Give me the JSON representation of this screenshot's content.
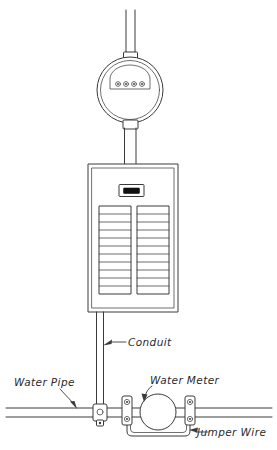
{
  "diagram": {
    "ink_color": "#3a3a3a",
    "background_color": "#ffffff",
    "labels": [
      {
        "id": "conduit",
        "text": "Conduit",
        "x": 128,
        "y": 344
      },
      {
        "id": "water-pipe",
        "text": "Water Pipe",
        "x": 14,
        "y": 384
      },
      {
        "id": "water-meter",
        "text": "Water Meter",
        "x": 150,
        "y": 382
      },
      {
        "id": "jumper-wire",
        "text": "Jumper Wire",
        "x": 197,
        "y": 437
      }
    ],
    "components": {
      "service_riser": {
        "name": "service-riser-conduit",
        "top_y": 10,
        "bottom_y": 55,
        "center_x": 130,
        "width": 9
      },
      "electric_meter": {
        "name": "electric-meter",
        "center_x": 130,
        "center_y": 89,
        "radius": 33,
        "dial_count": 4,
        "dial_labels": [
          "0",
          "0",
          "0",
          "0"
        ]
      },
      "meter_to_panel_conduit": {
        "name": "meter-panel-conduit",
        "top_y": 122,
        "bottom_y": 164,
        "center_x": 130,
        "width": 11
      },
      "breaker_panel": {
        "name": "breaker-panel",
        "x": 88,
        "y": 164,
        "width": 90,
        "height": 148,
        "main_breaker": {
          "name": "main-breaker",
          "x": 119,
          "y": 185,
          "width": 24,
          "height": 11
        },
        "breaker_columns": 2,
        "breaker_rows": 11
      },
      "ground_conduit": {
        "name": "grounding-conduit",
        "top_y": 312,
        "bottom_y": 410,
        "center_x": 100,
        "width": 7
      },
      "water_pipe": {
        "name": "water-pipe",
        "y": 412,
        "left_x": 6,
        "right_x": 272,
        "thickness": 9
      },
      "pipe_ground_clamp": {
        "name": "pipe-ground-clamp",
        "center_x": 100,
        "center_y": 414
      },
      "water_meter_body": {
        "name": "water-meter-body",
        "center_x": 158,
        "center_y": 412,
        "radius": 18
      },
      "bond_clamp_left": {
        "name": "bonding-clamp-left",
        "center_x": 127,
        "center_y": 412
      },
      "bond_clamp_right": {
        "name": "bonding-clamp-right",
        "center_x": 190,
        "center_y": 412
      },
      "jumper_wire": {
        "name": "jumper-wire-bond",
        "left_x": 127,
        "right_x": 190,
        "bottom_y": 438
      }
    }
  }
}
